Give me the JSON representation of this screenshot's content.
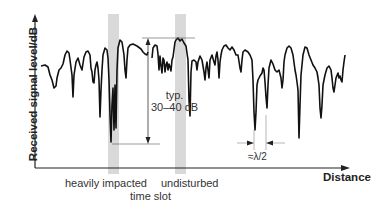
{
  "diagram": {
    "y_axis_label": "Received signal level/dB",
    "x_axis_label": "Distance",
    "annotations": {
      "typ_line1": "typ.",
      "typ_line2": "30–40 dB",
      "half_wavelength": "≈λ/2",
      "heavily_impacted": "heavily impacted",
      "time_slot": "time slot",
      "undisturbed": "undisturbed"
    },
    "colors": {
      "signal": "#111111",
      "shaded_slot": "#d9d9d9",
      "axis": "#222222"
    }
  }
}
